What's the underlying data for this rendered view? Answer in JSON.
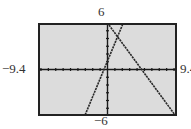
{
  "window": {
    "xmin_label": "−9.4",
    "xmax_label": "9.4",
    "ymin_label": "−6",
    "ymax_label": "6"
  },
  "colors": {
    "screen_bg": "#dcdcdc",
    "frame": "#222222",
    "axes": "#1a1a1a",
    "graph_line": "#2a2a2a"
  },
  "chart_data": {
    "type": "line",
    "title": "",
    "xlabel": "",
    "ylabel": "",
    "xlim": [
      -9.4,
      9.4
    ],
    "ylim": [
      -6,
      6
    ],
    "xscale_ticks": 1,
    "yscale_ticks": 1,
    "grid": false,
    "tick_labels": {
      "x": [
        "−9.4",
        "9.4"
      ],
      "y": [
        "−6",
        "6"
      ]
    },
    "series": [
      {
        "name": "line-1 (increasing)",
        "slope": 2.3,
        "intercept": 1.1,
        "points": [
          [
            -3.1,
            -6
          ],
          [
            0,
            1.1
          ],
          [
            2.13,
            6
          ]
        ]
      },
      {
        "name": "line-2 (decreasing)",
        "slope": -1.3,
        "intercept": 6,
        "points": [
          [
            0.6,
            5.2
          ],
          [
            4.6,
            0
          ],
          [
            9.4,
            -6.2
          ]
        ]
      }
    ],
    "intersection_approx": [
      1.3,
      4.1
    ]
  }
}
